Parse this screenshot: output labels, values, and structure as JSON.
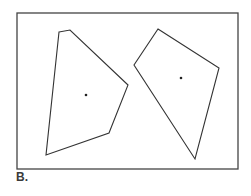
{
  "figure": {
    "label": "B.",
    "frame": {
      "x": 17,
      "y": 13,
      "width": 221,
      "height": 156,
      "stroke": "#444444"
    },
    "polygons": [
      {
        "name": "left-polygon",
        "points": [
          [
            59,
            32
          ],
          [
            70,
            30
          ],
          [
            128,
            85
          ],
          [
            109,
            133
          ],
          [
            46,
            155
          ]
        ],
        "centroid": [
          86,
          95
        ]
      },
      {
        "name": "right-polygon",
        "points": [
          [
            158,
            29
          ],
          [
            219,
            68
          ],
          [
            195,
            159
          ],
          [
            134,
            65
          ]
        ],
        "centroid": [
          181,
          78
        ]
      }
    ],
    "stroke_color": "#333333"
  }
}
